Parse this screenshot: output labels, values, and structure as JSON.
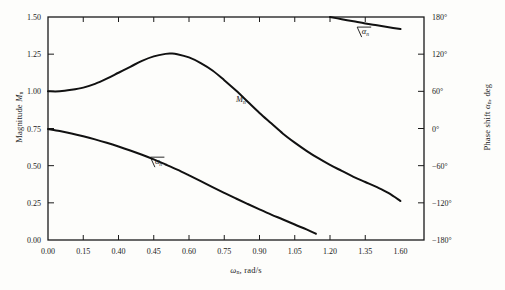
{
  "chart_data": {
    "type": "line",
    "title": "",
    "xlabel": "ωₙ, rad/s",
    "ylabel": "Magnitude Mₙ",
    "ylabel_right": "Phase shift αₙ, deg",
    "xlim": [
      0.0,
      1.6
    ],
    "ylim": [
      0.0,
      1.5
    ],
    "ylim_right": [
      -180,
      180
    ],
    "grid": false,
    "legend": "inline-curve-labels",
    "xticks": [
      "0.00",
      "0.15",
      "0.40",
      "0.45",
      "0.60",
      "0.75",
      "0.90",
      "1.05",
      "1.20",
      "1.35",
      "1.60"
    ],
    "xtick_values": [
      0.0,
      0.15,
      0.3,
      0.45,
      0.6,
      0.75,
      0.9,
      1.05,
      1.2,
      1.35,
      1.5
    ],
    "yticks_left": [
      "0.00",
      "0.25",
      "0.50",
      "0.75",
      "1.00",
      "1.25",
      "1.50"
    ],
    "ytick_values_left": [
      0.0,
      0.25,
      0.5,
      0.75,
      1.0,
      1.25,
      1.5
    ],
    "yticks_right": [
      "−180°",
      "−120°",
      "−60°",
      "0°",
      "60°",
      "120°",
      "180°"
    ],
    "ytick_values_right": [
      -180,
      -120,
      -60,
      0,
      60,
      120,
      180
    ],
    "series": [
      {
        "name": "Mₙ",
        "label": "M",
        "label_sub": "n",
        "axis": "left",
        "x": [
          0.0,
          0.05,
          0.1,
          0.15,
          0.2,
          0.25,
          0.3,
          0.35,
          0.4,
          0.45,
          0.5,
          0.525,
          0.55,
          0.6,
          0.65,
          0.7,
          0.75,
          0.8,
          0.85,
          0.9,
          0.95,
          1.0,
          1.05,
          1.1,
          1.15,
          1.2,
          1.25,
          1.3,
          1.35,
          1.4,
          1.45,
          1.5
        ],
        "values": [
          1.0,
          1.0,
          1.01,
          1.025,
          1.05,
          1.085,
          1.125,
          1.165,
          1.205,
          1.235,
          1.252,
          1.254,
          1.25,
          1.228,
          1.19,
          1.14,
          1.075,
          1.005,
          0.93,
          0.855,
          0.785,
          0.715,
          0.655,
          0.6,
          0.55,
          0.505,
          0.465,
          0.425,
          0.39,
          0.355,
          0.315,
          0.262
        ]
      },
      {
        "name": "∠αₙ (phase, branch 1)",
        "label": "∠α",
        "label_sub": "n",
        "axis": "right",
        "x": [
          0.0,
          0.05,
          0.1,
          0.15,
          0.2,
          0.25,
          0.3,
          0.35,
          0.4,
          0.45,
          0.5,
          0.55,
          0.6,
          0.65,
          0.7,
          0.75,
          0.8,
          0.85,
          0.9,
          0.95,
          1.0,
          1.05,
          1.1,
          1.14
        ],
        "values_deg": [
          -1.0,
          -4.0,
          -8.0,
          -12.5,
          -17.5,
          -23.0,
          -29.0,
          -35.5,
          -42.5,
          -50.0,
          -58.0,
          -66.5,
          -75.5,
          -85.0,
          -94.5,
          -104.0,
          -113.0,
          -122.0,
          -130.5,
          -139.0,
          -147.0,
          -155.0,
          -163.0,
          -170.0
        ],
        "values_left_scale": [
          0.746,
          0.733,
          0.717,
          0.698,
          0.677,
          0.654,
          0.629,
          0.602,
          0.573,
          0.542,
          0.508,
          0.473,
          0.435,
          0.396,
          0.356,
          0.317,
          0.279,
          0.242,
          0.206,
          0.171,
          0.138,
          0.104,
          0.071,
          0.042
        ]
      },
      {
        "name": "∠αₙ (phase, branch 2 wrapped)",
        "label": "∠α",
        "label_sub": "n",
        "axis": "right",
        "x": [
          1.2,
          1.25,
          1.3,
          1.35,
          1.4,
          1.45,
          1.5
        ],
        "values_deg": [
          180.0,
          176.5,
          173.0,
          169.5,
          166.5,
          163.5,
          160.5
        ]
      }
    ],
    "annotations": [
      {
        "text": "Mₙ",
        "x": 0.8,
        "y_left": 0.93,
        "name": "magnitude-curve-label"
      },
      {
        "text": "∠αₙ",
        "x": 0.44,
        "y_left": 0.5,
        "name": "phase-curve-label-lower"
      },
      {
        "text": "∠αₙ",
        "x": 1.32,
        "y_right": 150,
        "name": "phase-curve-label-upper"
      }
    ]
  },
  "axes": {
    "left_title_main": "Magnitude ",
    "left_title_italic": "M",
    "left_title_sub": "n",
    "right_title_main": "Phase shift ",
    "right_title_italic": "α",
    "right_title_sub": "n",
    "right_title_tail": ", deg",
    "x_title_italic": "ω",
    "x_title_sub": "n",
    "x_title_tail": ", rad/s"
  },
  "style": {
    "curve_color": "#111111",
    "axis_color": "#1a1a1a",
    "background": "#fdfdfb"
  }
}
